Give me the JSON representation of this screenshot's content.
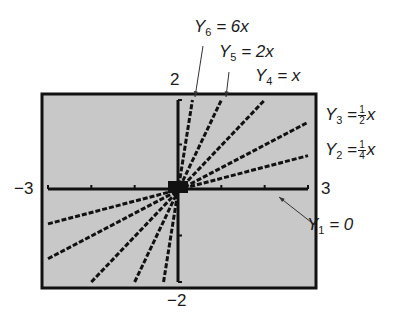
{
  "chart_data": {
    "type": "line",
    "title": "",
    "xlabel": "",
    "ylabel": "",
    "xlim": [
      -3,
      3
    ],
    "ylim": [
      -2,
      2
    ],
    "grid": false,
    "tick_labels": {
      "xmin": "−3",
      "xmax": "3",
      "ymin": "−2",
      "ymax": "2"
    },
    "x_ticks": [
      -3,
      -2,
      -1,
      0,
      1,
      2,
      3
    ],
    "y_ticks": [
      -2,
      -1,
      0,
      1,
      2
    ],
    "background": "#c8c8c8",
    "line_color": "#111111",
    "series": [
      {
        "name": "Y1",
        "expr": "0",
        "slope": 0,
        "label": "Y1 = 0"
      },
      {
        "name": "Y2",
        "expr": "1/4 x",
        "slope": 0.25,
        "label": "Y2 = 1/4 x"
      },
      {
        "name": "Y3",
        "expr": "1/2 x",
        "slope": 0.5,
        "label": "Y3 = 1/2 x"
      },
      {
        "name": "Y4",
        "expr": "x",
        "slope": 1,
        "label": "Y4 = x"
      },
      {
        "name": "Y5",
        "expr": "2x",
        "slope": 2,
        "label": "Y5 = 2x"
      },
      {
        "name": "Y6",
        "expr": "6x",
        "slope": 6,
        "label": "Y6 = 6x"
      }
    ]
  },
  "labels": {
    "y6": {
      "var": "Y",
      "sub": "6",
      "rhs": "= 6x"
    },
    "y5": {
      "var": "Y",
      "sub": "5",
      "rhs": "= 2x"
    },
    "y4": {
      "var": "Y",
      "sub": "4",
      "rhs": "= x"
    },
    "y3": {
      "var": "Y",
      "sub": "3",
      "eq": "=",
      "num": "1",
      "den": "2",
      "x": "x"
    },
    "y2": {
      "var": "Y",
      "sub": "2",
      "eq": "=",
      "num": "1",
      "den": "4",
      "x": "x"
    },
    "y1": {
      "var": "Y",
      "sub": "1",
      "rhs": "= 0"
    }
  }
}
